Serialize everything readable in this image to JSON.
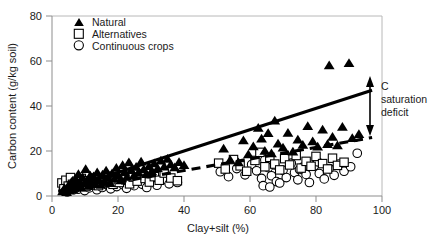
{
  "chart_data": {
    "type": "scatter",
    "title": "",
    "xlabel": "Clay+silt (%)",
    "ylabel": "Carbon content (g/kg soil)",
    "xlim": [
      0,
      100
    ],
    "ylim": [
      0,
      80
    ],
    "xticks": [
      0,
      20,
      40,
      60,
      80,
      100
    ],
    "yticks": [
      0,
      20,
      40,
      60,
      80
    ],
    "grid": false,
    "legend_position": "top-left",
    "legend": [
      {
        "label": "Natural",
        "marker": "filled-triangle"
      },
      {
        "label": "Alternatives",
        "marker": "open-square"
      },
      {
        "label": "Continuous crops",
        "marker": "open-circle"
      }
    ],
    "annotations": [
      {
        "text": "C saturation deficit",
        "text_lines": [
          "C",
          "saturation",
          "deficit"
        ],
        "marker": "double-headed-vertical-arrow",
        "x": 97,
        "y_from": 26,
        "y_to": 47
      }
    ],
    "trendlines": [
      {
        "name": "Natural (solid)",
        "style": "solid",
        "x": [
          2,
          97
        ],
        "y": [
          2.0,
          47.0
        ]
      },
      {
        "name": "Cropped (dashed)",
        "style": "dashed",
        "x": [
          2,
          97
        ],
        "y": [
          1.5,
          26.0
        ]
      }
    ],
    "series": [
      {
        "name": "Natural",
        "marker": "filled-triangle",
        "points": [
          [
            3.2,
            2.0
          ],
          [
            3.8,
            3.4
          ],
          [
            4.4,
            1.6
          ],
          [
            5.0,
            4.6
          ],
          [
            5.4,
            2.4
          ],
          [
            5.9,
            6.2
          ],
          [
            6.3,
            3.0
          ],
          [
            6.8,
            5.0
          ],
          [
            7.1,
            7.4
          ],
          [
            7.6,
            4.0
          ],
          [
            8.0,
            9.6
          ],
          [
            8.4,
            6.4
          ],
          [
            8.9,
            3.6
          ],
          [
            9.3,
            8.2
          ],
          [
            9.8,
            5.4
          ],
          [
            10.2,
            11.8
          ],
          [
            10.7,
            7.0
          ],
          [
            11.1,
            4.4
          ],
          [
            11.6,
            9.0
          ],
          [
            12.0,
            6.0
          ],
          [
            12.6,
            8.6
          ],
          [
            13.1,
            5.2
          ],
          [
            13.7,
            10.4
          ],
          [
            14.2,
            7.2
          ],
          [
            14.8,
            4.8
          ],
          [
            15.3,
            9.4
          ],
          [
            15.9,
            6.6
          ],
          [
            16.4,
            11.2
          ],
          [
            17.0,
            8.0
          ],
          [
            17.6,
            5.6
          ],
          [
            18.2,
            10.0
          ],
          [
            18.9,
            7.6
          ],
          [
            19.5,
            12.4
          ],
          [
            20.1,
            9.2
          ],
          [
            20.8,
            6.8
          ],
          [
            21.4,
            13.6
          ],
          [
            22.0,
            10.6
          ],
          [
            22.7,
            8.4
          ],
          [
            23.3,
            14.8
          ],
          [
            24.0,
            11.4
          ],
          [
            24.8,
            9.0
          ],
          [
            25.5,
            12.8
          ],
          [
            26.2,
            10.2
          ],
          [
            27.0,
            15.2
          ],
          [
            27.8,
            11.8
          ],
          [
            28.6,
            9.6
          ],
          [
            29.4,
            13.2
          ],
          [
            30.2,
            11.0
          ],
          [
            31.0,
            14.4
          ],
          [
            32.0,
            12.2
          ],
          [
            33.0,
            15.6
          ],
          [
            34.0,
            13.0
          ],
          [
            35.0,
            16.4
          ],
          [
            36.0,
            14.0
          ],
          [
            37.2,
            12.6
          ],
          [
            38.5,
            15.0
          ],
          [
            40.0,
            13.6
          ],
          [
            52.0,
            21.0
          ],
          [
            54.0,
            16.0
          ],
          [
            56.5,
            14.8
          ],
          [
            58.0,
            24.6
          ],
          [
            59.5,
            18.4
          ],
          [
            61.0,
            22.0
          ],
          [
            62.5,
            30.2
          ],
          [
            63.5,
            25.4
          ],
          [
            64.5,
            20.0
          ],
          [
            65.5,
            27.8
          ],
          [
            66.5,
            18.8
          ],
          [
            67.5,
            33.4
          ],
          [
            68.5,
            23.2
          ],
          [
            70.0,
            21.4
          ],
          [
            71.5,
            28.0
          ],
          [
            73.0,
            19.6
          ],
          [
            74.5,
            25.0
          ],
          [
            76.0,
            22.6
          ],
          [
            77.5,
            31.0
          ],
          [
            79.0,
            24.2
          ],
          [
            80.5,
            21.8
          ],
          [
            82.0,
            29.4
          ],
          [
            83.5,
            23.0
          ],
          [
            84.0,
            58.0
          ],
          [
            85.0,
            26.2
          ],
          [
            86.5,
            22.4
          ],
          [
            88.0,
            30.6
          ],
          [
            90.0,
            59.0
          ],
          [
            91.0,
            25.6
          ],
          [
            93.0,
            27.4
          ]
        ]
      },
      {
        "name": "Alternatives",
        "marker": "open-square",
        "points": [
          [
            3.0,
            5.8
          ],
          [
            3.6,
            3.2
          ],
          [
            4.2,
            7.0
          ],
          [
            4.9,
            4.4
          ],
          [
            5.6,
            8.2
          ],
          [
            6.2,
            5.2
          ],
          [
            6.9,
            3.8
          ],
          [
            7.5,
            6.6
          ],
          [
            8.2,
            4.8
          ],
          [
            8.9,
            7.8
          ],
          [
            9.6,
            5.6
          ],
          [
            10.3,
            4.2
          ],
          [
            11.0,
            6.8
          ],
          [
            11.8,
            5.0
          ],
          [
            12.5,
            8.0
          ],
          [
            13.3,
            6.2
          ],
          [
            14.1,
            4.6
          ],
          [
            15.0,
            7.4
          ],
          [
            15.8,
            5.8
          ],
          [
            16.7,
            8.8
          ],
          [
            17.6,
            6.4
          ],
          [
            18.5,
            5.2
          ],
          [
            19.4,
            7.6
          ],
          [
            20.4,
            6.0
          ],
          [
            21.4,
            9.2
          ],
          [
            22.4,
            7.2
          ],
          [
            23.5,
            5.4
          ],
          [
            24.6,
            8.4
          ],
          [
            25.8,
            6.6
          ],
          [
            27.0,
            9.8
          ],
          [
            28.2,
            7.8
          ],
          [
            29.5,
            6.2
          ],
          [
            31.0,
            8.6
          ],
          [
            32.5,
            7.0
          ],
          [
            34.0,
            10.2
          ],
          [
            36.0,
            8.0
          ],
          [
            38.0,
            6.8
          ],
          [
            50.5,
            14.6
          ],
          [
            52.5,
            12.0
          ],
          [
            55.0,
            16.2
          ],
          [
            57.0,
            13.4
          ],
          [
            59.0,
            11.0
          ],
          [
            61.5,
            15.8
          ],
          [
            63.0,
            19.4
          ],
          [
            64.5,
            13.0
          ],
          [
            66.0,
            17.2
          ],
          [
            67.5,
            14.2
          ],
          [
            69.0,
            11.6
          ],
          [
            70.5,
            16.6
          ],
          [
            72.0,
            13.8
          ],
          [
            74.0,
            18.0
          ],
          [
            75.5,
            12.4
          ],
          [
            77.0,
            15.4
          ],
          [
            78.5,
            13.2
          ],
          [
            80.0,
            17.6
          ],
          [
            82.0,
            14.4
          ],
          [
            83.5,
            12.0
          ],
          [
            85.0,
            16.8
          ],
          [
            86.5,
            13.6
          ],
          [
            88.5,
            15.0
          ]
        ]
      },
      {
        "name": "Continuous crops",
        "marker": "open-circle",
        "points": [
          [
            3.4,
            2.6
          ],
          [
            4.0,
            4.2
          ],
          [
            4.6,
            1.8
          ],
          [
            5.2,
            3.4
          ],
          [
            5.8,
            5.4
          ],
          [
            6.5,
            2.8
          ],
          [
            7.2,
            4.6
          ],
          [
            7.9,
            3.0
          ],
          [
            8.6,
            6.0
          ],
          [
            9.2,
            4.0
          ],
          [
            9.9,
            2.4
          ],
          [
            10.6,
            5.2
          ],
          [
            11.3,
            3.6
          ],
          [
            12.1,
            6.4
          ],
          [
            12.8,
            4.4
          ],
          [
            13.6,
            2.8
          ],
          [
            14.4,
            5.6
          ],
          [
            15.2,
            3.8
          ],
          [
            16.0,
            6.8
          ],
          [
            16.9,
            4.8
          ],
          [
            17.8,
            3.2
          ],
          [
            18.7,
            5.8
          ],
          [
            19.6,
            4.2
          ],
          [
            20.6,
            7.0
          ],
          [
            21.6,
            5.0
          ],
          [
            22.6,
            3.4
          ],
          [
            23.7,
            6.2
          ],
          [
            24.9,
            4.6
          ],
          [
            26.1,
            7.4
          ],
          [
            27.4,
            5.2
          ],
          [
            28.7,
            3.8
          ],
          [
            30.2,
            6.6
          ],
          [
            31.8,
            4.8
          ],
          [
            33.5,
            7.2
          ],
          [
            35.5,
            5.4
          ],
          [
            38.0,
            6.0
          ],
          [
            51.0,
            10.8
          ],
          [
            53.5,
            8.6
          ],
          [
            56.0,
            12.2
          ],
          [
            58.5,
            9.4
          ],
          [
            60.5,
            14.0
          ],
          [
            62.0,
            11.2
          ],
          [
            63.5,
            7.8
          ],
          [
            64.5,
            16.0
          ],
          [
            65.5,
            12.6
          ],
          [
            66.5,
            9.0
          ],
          [
            67.5,
            13.8
          ],
          [
            68.0,
            6.4
          ],
          [
            69.0,
            5.8
          ],
          [
            70.0,
            11.4
          ],
          [
            71.0,
            8.2
          ],
          [
            72.5,
            14.6
          ],
          [
            73.5,
            10.4
          ],
          [
            74.5,
            7.2
          ],
          [
            76.0,
            12.8
          ],
          [
            77.0,
            9.6
          ],
          [
            78.0,
            6.0
          ],
          [
            79.5,
            13.4
          ],
          [
            81.0,
            10.0
          ],
          [
            82.5,
            7.6
          ],
          [
            84.0,
            12.2
          ],
          [
            85.5,
            9.2
          ],
          [
            87.0,
            14.2
          ],
          [
            88.5,
            11.0
          ],
          [
            90.5,
            13.0
          ],
          [
            92.5,
            19.0
          ],
          [
            64.0,
            4.6
          ],
          [
            66.0,
            4.0
          ],
          [
            75.0,
            11.8
          ],
          [
            80.5,
            15.2
          ]
        ]
      }
    ]
  }
}
